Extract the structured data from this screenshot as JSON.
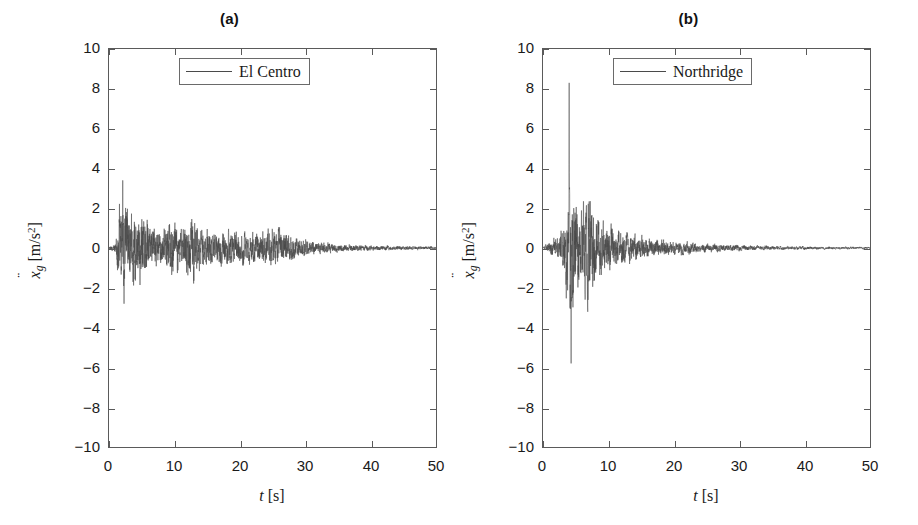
{
  "figure": {
    "width": 918,
    "height": 525,
    "background": "#ffffff",
    "line_color": "#4a4a4a",
    "axis_color": "#5a5a5a",
    "text_color": "#1a1a1a"
  },
  "axis_titles": {
    "x_symbol": "t",
    "x_unit": "[s]",
    "y_symbol": "x",
    "y_subscript": "g",
    "y_unit_open": "[m/s",
    "y_unit_exp": "2",
    "y_unit_close": "]"
  },
  "panels": [
    {
      "title": "(a)",
      "legend_label": "El Centro",
      "xticks": [
        0,
        10,
        20,
        30,
        40,
        50
      ],
      "yticks": [
        10,
        8,
        6,
        4,
        2,
        0,
        -2,
        -4,
        -6,
        -8,
        -10
      ]
    },
    {
      "title": "(b)",
      "legend_label": "Northridge",
      "xticks": [
        0,
        10,
        20,
        30,
        40,
        50
      ],
      "yticks": [
        10,
        8,
        6,
        4,
        2,
        0,
        -2,
        -4,
        -6,
        -8,
        -10
      ]
    }
  ],
  "chart_data": [
    {
      "type": "line",
      "title": "(a)",
      "series_name": "El Centro",
      "xlabel": "t [s]",
      "ylabel": "x_g [m/s^2]",
      "xlim": [
        0,
        50
      ],
      "ylim": [
        -10,
        10
      ],
      "xticks": [
        0,
        10,
        20,
        30,
        40,
        50
      ],
      "yticks": [
        -10,
        -8,
        -6,
        -4,
        -2,
        0,
        2,
        4,
        6,
        8,
        10
      ],
      "grid": false,
      "legend_position": "upper right",
      "units": "m/s^2",
      "duration_s": 50,
      "sample_dt_s": 0.02,
      "peak_positive": 3.4,
      "peak_positive_time_s": 2.1,
      "peak_negative": -2.8,
      "peak_negative_time_s": 2.3,
      "envelope_description": "rapid rise to strong motion at ~1.5 s, sustained shaking to ~10 s, gradual decay through ~28 s, low-amplitude coda to 50 s",
      "envelope_points": [
        {
          "t": 0.0,
          "amp": 0.05
        },
        {
          "t": 1.0,
          "amp": 0.35
        },
        {
          "t": 1.6,
          "amp": 2.4
        },
        {
          "t": 2.1,
          "amp": 3.4
        },
        {
          "t": 3.0,
          "amp": 2.3
        },
        {
          "t": 4.2,
          "amp": 2.5
        },
        {
          "t": 5.2,
          "amp": 2.0
        },
        {
          "t": 6.5,
          "amp": 1.3
        },
        {
          "t": 8.0,
          "amp": 1.0
        },
        {
          "t": 9.5,
          "amp": 1.8
        },
        {
          "t": 11.0,
          "amp": 1.2
        },
        {
          "t": 12.5,
          "amp": 2.1
        },
        {
          "t": 14.0,
          "amp": 1.2
        },
        {
          "t": 17.0,
          "amp": 1.1
        },
        {
          "t": 20.0,
          "amp": 1.0
        },
        {
          "t": 23.0,
          "amp": 0.9
        },
        {
          "t": 25.5,
          "amp": 1.2
        },
        {
          "t": 27.0,
          "amp": 1.1
        },
        {
          "t": 29.0,
          "amp": 0.6
        },
        {
          "t": 32.0,
          "amp": 0.35
        },
        {
          "t": 36.0,
          "amp": 0.22
        },
        {
          "t": 40.0,
          "amp": 0.16
        },
        {
          "t": 45.0,
          "amp": 0.12
        },
        {
          "t": 50.0,
          "amp": 0.1
        }
      ],
      "dominant_frequencies_hz": [
        1.2,
        2.1,
        3.3,
        4.7,
        6.1
      ],
      "seed": 1337
    },
    {
      "type": "line",
      "title": "(b)",
      "series_name": "Northridge",
      "xlabel": "t [s]",
      "ylabel": "x_g [m/s^2]",
      "xlim": [
        0,
        50
      ],
      "ylim": [
        -10,
        10
      ],
      "xticks": [
        0,
        10,
        20,
        30,
        40,
        50
      ],
      "yticks": [
        -10,
        -8,
        -6,
        -4,
        -2,
        0,
        2,
        4,
        6,
        8,
        10
      ],
      "grid": false,
      "legend_position": "upper right",
      "units": "m/s^2",
      "duration_s": 50,
      "sample_dt_s": 0.02,
      "peak_positive": 8.3,
      "peak_positive_time_s": 4.0,
      "peak_negative": -5.8,
      "peak_negative_time_s": 4.3,
      "envelope_description": "quiet start, abrupt near-fault velocity pulse at ~4 s reaching 8.3 m/s^2, secondary burst at ~6.5-8 s, rapid decay after ~12 s, very low coda to 50 s",
      "envelope_points": [
        {
          "t": 0.0,
          "amp": 0.05
        },
        {
          "t": 1.2,
          "amp": 0.5
        },
        {
          "t": 2.4,
          "amp": 0.9
        },
        {
          "t": 3.2,
          "amp": 1.4
        },
        {
          "t": 3.8,
          "amp": 5.5
        },
        {
          "t": 4.0,
          "amp": 8.3
        },
        {
          "t": 4.3,
          "amp": 5.8
        },
        {
          "t": 4.8,
          "amp": 3.6
        },
        {
          "t": 5.5,
          "amp": 2.6
        },
        {
          "t": 6.3,
          "amp": 3.0
        },
        {
          "t": 6.9,
          "amp": 4.2
        },
        {
          "t": 7.6,
          "amp": 2.6
        },
        {
          "t": 8.4,
          "amp": 2.2
        },
        {
          "t": 9.5,
          "amp": 1.7
        },
        {
          "t": 11.0,
          "amp": 1.3
        },
        {
          "t": 13.0,
          "amp": 0.95
        },
        {
          "t": 15.0,
          "amp": 0.7
        },
        {
          "t": 18.0,
          "amp": 0.55
        },
        {
          "t": 21.0,
          "amp": 0.42
        },
        {
          "t": 25.0,
          "amp": 0.3
        },
        {
          "t": 30.0,
          "amp": 0.2
        },
        {
          "t": 35.0,
          "amp": 0.14
        },
        {
          "t": 40.0,
          "amp": 0.11
        },
        {
          "t": 45.0,
          "amp": 0.09
        },
        {
          "t": 50.0,
          "amp": 0.07
        }
      ],
      "dominant_frequencies_hz": [
        0.9,
        1.7,
        2.8,
        4.2,
        5.6
      ],
      "seed": 90210
    }
  ]
}
